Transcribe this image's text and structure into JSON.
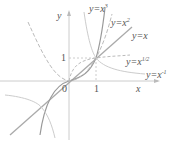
{
  "axes": {
    "x_label": "x",
    "y_label": "y",
    "origin": "0",
    "tick_x": "1",
    "tick_y": "1"
  },
  "curves": [
    {
      "name": "y=x^3",
      "base": "y=x",
      "exp": "3"
    },
    {
      "name": "y=x^2",
      "base": "y=x",
      "exp": "2"
    },
    {
      "name": "y=x",
      "base": "y=x",
      "exp": ""
    },
    {
      "name": "y=x^1/2",
      "base": "y=x",
      "exp": "1/2"
    },
    {
      "name": "y=x^-1",
      "base": "y=x",
      "exp": "-1"
    }
  ],
  "colors": {
    "curve": "#aaaaaa",
    "axis": "#cccccc",
    "text": "#555555"
  }
}
